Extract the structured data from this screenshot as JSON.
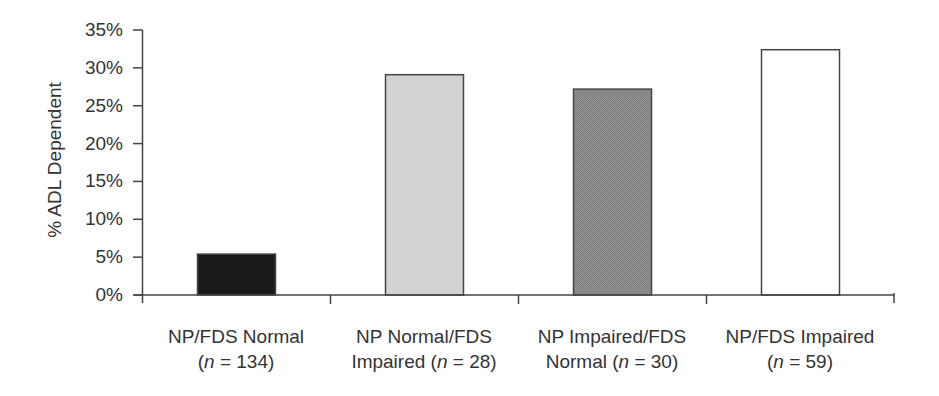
{
  "chart_data": {
    "type": "bar",
    "title": "",
    "xlabel": "",
    "ylabel": "% ADL Dependent",
    "ylim": [
      0,
      35
    ],
    "yticks": [
      "0%",
      "5%",
      "10%",
      "15%",
      "20%",
      "25%",
      "30%",
      "35%"
    ],
    "grid": false,
    "legend": null,
    "categories": [
      "NP/FDS Normal (n = 134)",
      "NP Normal/FDS Impaired (n = 28)",
      "NP Impaired/FDS Normal (n = 30)",
      "NP/FDS Impaired (n = 59)"
    ],
    "category_lines": [
      [
        "NP/FDS Normal",
        "(n = 134)"
      ],
      [
        "NP Normal/FDS",
        "Impaired (n = 28)"
      ],
      [
        "NP Impaired/FDS",
        "Normal (n = 30)"
      ],
      [
        "NP/FDS Impaired",
        "(n = 59)"
      ]
    ],
    "values": [
      5.4,
      29.1,
      27.2,
      32.4
    ],
    "units": "%",
    "bar_colors": [
      "#1a1a1a",
      "#d6d6d6",
      "#8c8c8c",
      "#ffffff"
    ],
    "bar_edge_color": "#444444"
  },
  "axis": {
    "ylabel": "% ADL Dependent",
    "yticks": [
      "0%",
      "5%",
      "10%",
      "15%",
      "20%",
      "25%",
      "30%",
      "35%"
    ]
  },
  "categories": [
    {
      "line1": "NP/FDS Normal",
      "pre": "(",
      "n": "n",
      "post": " = 134)"
    },
    {
      "line1": "NP Normal/FDS",
      "pre": "Impaired (",
      "n": "n",
      "post": " = 28)"
    },
    {
      "line1": "NP Impaired/FDS",
      "pre": "Normal (",
      "n": "n",
      "post": " = 30)"
    },
    {
      "line1": "NP/FDS Impaired",
      "pre": "(",
      "n": "n",
      "post": " = 59)"
    }
  ]
}
